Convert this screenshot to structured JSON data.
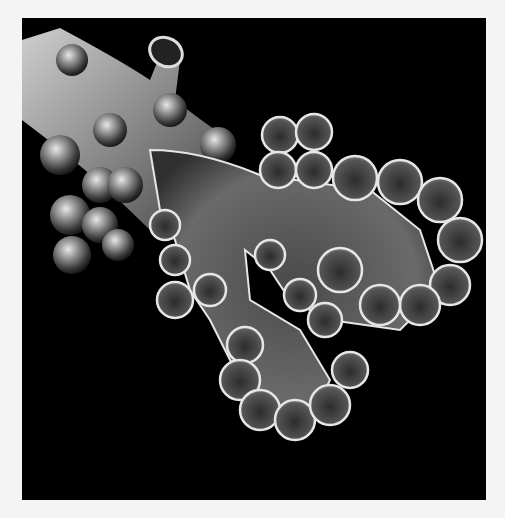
{
  "image": {
    "subject": "bronchiole-and-alveoli-illustration",
    "style": "grayscale medical illustration on black background",
    "colors": {
      "background": "#000000",
      "page": "#f4f4f4",
      "tissue_light": "#d8d8d8",
      "tissue_mid": "#7a7a7a",
      "tissue_dark": "#2e2e2e",
      "rim": "#e6e6e6"
    }
  }
}
